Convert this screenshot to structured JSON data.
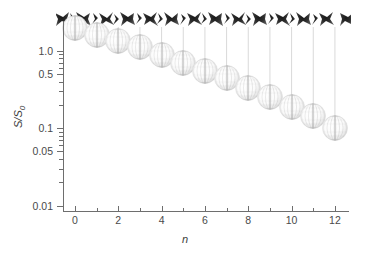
{
  "figure": {
    "background_color": "#ffffff",
    "axis_color": "#6e6e6e",
    "text_color": "#3d3d3d"
  },
  "axes": {
    "x_title": "n",
    "y_title_main": "S/S",
    "y_title_sub": "0",
    "x_ticks_major": [
      0,
      2,
      4,
      6,
      8,
      10,
      12
    ],
    "x_tick_labels": [
      "0",
      "2",
      "4",
      "6",
      "8",
      "10",
      "12"
    ],
    "x_ticks_minor": [
      1,
      3,
      5,
      7,
      9,
      11
    ],
    "y_ticks_major": [
      1.0,
      0.5,
      0.1,
      0.05,
      0.01
    ],
    "y_tick_labels": [
      "1.0",
      "0.5",
      "0.1",
      "0.05",
      "0.01"
    ],
    "y_ticks_minor": [
      0.9,
      0.8,
      0.7,
      0.6,
      0.4,
      0.3,
      0.2,
      0.09,
      0.08,
      0.07,
      0.06,
      0.04,
      0.03,
      0.02
    ],
    "x_range": [
      -0.55,
      12.65
    ],
    "y_range": [
      0.0085,
      2.35
    ],
    "y_scale": "log",
    "grid": false,
    "legend": "none"
  },
  "chart_data": {
    "type": "scatter",
    "title": "",
    "subtitle": "",
    "xlabel": "n",
    "ylabel": "S/S0",
    "yscale": "log",
    "xlim": [
      -0.55,
      12.65
    ],
    "ylim": [
      0.0085,
      2.35
    ],
    "grid": false,
    "legend_position": "none",
    "marker_style": "sphere-snapshot-image",
    "series": [
      {
        "name": "S/S0",
        "x": [
          0,
          1,
          2,
          3,
          4,
          5,
          6,
          7,
          8,
          9,
          10,
          11,
          12
        ],
        "values": [
          1.95,
          1.62,
          1.35,
          1.12,
          0.88,
          0.7,
          0.55,
          0.44,
          0.33,
          0.25,
          0.19,
          0.145,
          0.1
        ]
      }
    ],
    "annotations": [
      {
        "name": "structure-band",
        "description": "Row of 13 dark molecular/cluster structure snapshots above the plot, one per n value",
        "count": 13
      },
      {
        "name": "drop-lines",
        "description": "Thin vertical lines connecting each structure snapshot to its corresponding sphere marker",
        "count": 13
      }
    ]
  }
}
